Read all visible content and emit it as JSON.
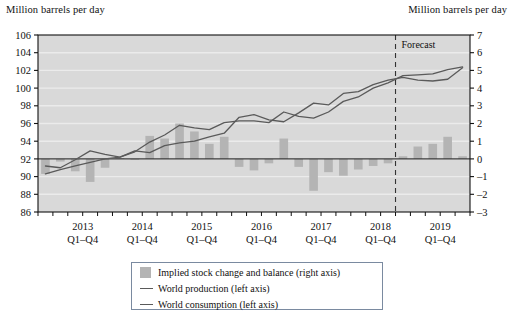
{
  "axis_titles": {
    "left": "Million barrels per day",
    "right": "Million barrels per day"
  },
  "annotations": {
    "forecast": "Forecast"
  },
  "legend": {
    "items": [
      {
        "key": "bars",
        "label": "Implied stock change and balance (right axis)",
        "marker": "swatch",
        "color": "#b4b4b4"
      },
      {
        "key": "production",
        "label": "World production (left axis)",
        "marker": "line",
        "color": "#5a5a5a"
      },
      {
        "key": "consumption",
        "label": "World consumption (left axis)",
        "marker": "line",
        "color": "#5a5a5a"
      }
    ]
  },
  "colors": {
    "plot_background": "#d9d9d9",
    "gridline": "#ebebeb",
    "bar": "#b4b4b4",
    "line": "#5a5a5a",
    "axis": "#111111",
    "zero_line": "#3a3a3a",
    "forecast_divider": "#333333",
    "legend_border": "#7a8aa0"
  },
  "chart_data": {
    "type": "bar",
    "title": "",
    "subtitle": "",
    "xlabel": "",
    "ylabel": "Million barrels per day",
    "grid": true,
    "legend_position": "bottom",
    "x_tick_labels": [
      {
        "year": "2013",
        "quarters": "Q1–Q4"
      },
      {
        "year": "2014",
        "quarters": "Q1–Q4"
      },
      {
        "year": "2015",
        "quarters": "Q1–Q4"
      },
      {
        "year": "2016",
        "quarters": "Q1–Q4"
      },
      {
        "year": "2017",
        "quarters": "Q1–Q4"
      },
      {
        "year": "2018",
        "quarters": "Q1–Q4"
      },
      {
        "year": "2019",
        "quarters": "Q1–Q4"
      }
    ],
    "left_axis": {
      "label": "Million barrels per day",
      "ticks": [
        86,
        88,
        90,
        92,
        94,
        96,
        98,
        100,
        102,
        104,
        106
      ],
      "ylim": [
        86,
        106
      ]
    },
    "right_axis": {
      "label": "Million barrels per day",
      "ticks": [
        -3,
        -2,
        -1,
        0,
        1,
        2,
        3,
        4,
        5,
        6,
        7
      ],
      "ylim": [
        -3,
        7
      ]
    },
    "forecast_start_index": 24,
    "forecast_label": "Forecast",
    "x": [
      "2012Q4",
      "2013Q1",
      "2013Q2",
      "2013Q3",
      "2013Q4",
      "2014Q1",
      "2014Q2",
      "2014Q3",
      "2014Q4",
      "2015Q1",
      "2015Q2",
      "2015Q3",
      "2015Q4",
      "2016Q1",
      "2016Q2",
      "2016Q3",
      "2016Q4",
      "2017Q1",
      "2017Q2",
      "2017Q3",
      "2017Q4",
      "2018Q1",
      "2018Q2",
      "2018Q3",
      "2018Q4",
      "2019Q1",
      "2019Q2",
      "2019Q3",
      "2019Q4"
    ],
    "series": [
      {
        "name": "Implied stock change and balance (right axis)",
        "type": "bar",
        "axis": "right",
        "values": [
          -0.85,
          -0.15,
          -0.7,
          -1.3,
          -0.5,
          0.05,
          -0.05,
          1.3,
          1.15,
          2.0,
          1.55,
          0.85,
          1.25,
          -0.45,
          -0.65,
          -0.25,
          1.15,
          -0.45,
          -1.8,
          -0.75,
          -0.95,
          -0.6,
          -0.4,
          -0.25,
          0.15,
          0.7,
          0.85,
          1.25,
          0.15
        ]
      },
      {
        "name": "World production (left axis)",
        "type": "line",
        "axis": "left",
        "values": [
          90.3,
          90.8,
          91.2,
          91.6,
          92.0,
          92.2,
          92.8,
          93.9,
          94.7,
          95.8,
          95.5,
          95.3,
          96.1,
          96.3,
          96.3,
          96.1,
          97.3,
          96.8,
          96.6,
          97.3,
          98.5,
          99.0,
          100.0,
          100.6,
          101.4,
          101.5,
          101.6,
          102.1,
          102.4
        ]
      },
      {
        "name": "World consumption (left axis)",
        "type": "line",
        "axis": "left",
        "values": [
          91.2,
          91.0,
          91.9,
          92.9,
          92.5,
          92.2,
          92.9,
          92.7,
          93.5,
          93.8,
          94.0,
          94.5,
          94.9,
          96.7,
          97.0,
          96.4,
          96.2,
          97.2,
          98.3,
          98.1,
          99.4,
          99.6,
          100.4,
          100.9,
          101.2,
          100.9,
          100.8,
          101.0,
          102.3
        ]
      }
    ]
  }
}
